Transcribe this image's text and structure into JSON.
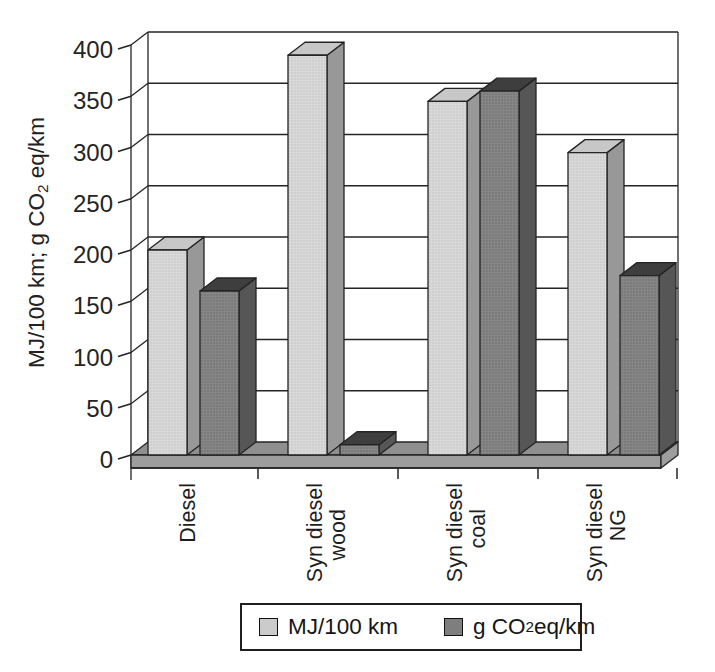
{
  "figure": {
    "kind": "scanned 3D column chart",
    "background": "#ffffff"
  },
  "y_axis": {
    "title_prefix": "MJ/100 km; g CO",
    "title_sub": "2",
    "title_suffix": " eq/km",
    "tick_min": 0,
    "tick_max": 400,
    "tick_step": 50
  },
  "legend": {
    "items": [
      {
        "prefix": "MJ/100 km",
        "sub": "",
        "suffix": "",
        "swatch": "#cbcbcb"
      },
      {
        "prefix": "g CO",
        "sub": "2",
        "suffix": " eq/km",
        "swatch": "#7e7e7e"
      }
    ]
  },
  "chart_data": {
    "type": "bar",
    "style": "3d-column",
    "categories": [
      "Diesel",
      "Syn diesel wood",
      "Syn diesel coal",
      "Syn diesel NG"
    ],
    "categories_lines": [
      [
        "Diesel"
      ],
      [
        "Syn diesel",
        "wood"
      ],
      [
        "Syn diesel",
        "coal"
      ],
      [
        "Syn diesel",
        "NG"
      ]
    ],
    "series": [
      {
        "name": "MJ/100 km",
        "values": [
          200,
          390,
          345,
          295
        ]
      },
      {
        "name": "g CO2 eq/km",
        "values": [
          160,
          10,
          355,
          175
        ]
      }
    ],
    "title": "",
    "xlabel": "",
    "ylabel": "MJ/100 km; g CO2 eq/km",
    "ylim": [
      0,
      400
    ],
    "ytick_step": 50,
    "grid": true,
    "legend_position": "bottom"
  },
  "colors": {
    "s1_front": "#d7d7d7",
    "s1_top": "#c7c7c7",
    "s1_side": "#989898",
    "s1_dot": "#bcbcbc",
    "s2_front": "#848484",
    "s2_top": "#3e3e3e",
    "s2_side": "#565656",
    "s2_dot": "#6a6a6a",
    "floor_front": "#9d9d9d",
    "floor_top": "#8f8f8f",
    "line": "#242424",
    "tick_text": "#242424"
  }
}
